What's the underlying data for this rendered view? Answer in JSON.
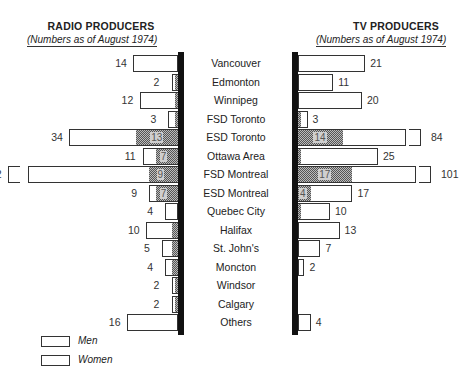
{
  "left_panel": {
    "title": "RADIO PRODUCERS",
    "subtitle": "(Numbers as of August 1974)"
  },
  "right_panel": {
    "title": "TV PRODUCERS",
    "subtitle": "(Numbers as of August 1974)"
  },
  "legend": {
    "men": "Men",
    "women": "Women"
  },
  "colors": {
    "men_fill": "#ffffff",
    "women_fill": "#999999",
    "axis": "#111111"
  },
  "chart_data": {
    "type": "bar",
    "orientation": "horizontal-back-to-back",
    "categories": [
      "Vancouver",
      "Edmonton",
      "Winnipeg",
      "FSD Toronto",
      "ESD Toronto",
      "Ottawa Area",
      "FSD Montreal",
      "ESD Montreal",
      "Quebec City",
      "Halifax",
      "St. John's",
      "Moncton",
      "Windsor",
      "Calgary",
      "Others"
    ],
    "panels": [
      {
        "name": "RADIO PRODUCERS",
        "direction": "left",
        "series": [
          {
            "name": "Men",
            "values": [
              14,
              2,
              12,
              3,
              34,
              11,
              52,
              9,
              4,
              10,
              5,
              4,
              2,
              2,
              16
            ]
          },
          {
            "name": "Women",
            "values": [
              0,
              1,
              1,
              1,
              13,
              7,
              9,
              7,
              0,
              2,
              2,
              2,
              1,
              1,
              0
            ]
          }
        ],
        "women_labels_shown": [
          null,
          null,
          null,
          null,
          13,
          7,
          9,
          7,
          null,
          null,
          null,
          null,
          null,
          null,
          null
        ],
        "broken_bars": [
          "FSD Montreal"
        ]
      },
      {
        "name": "TV PRODUCERS",
        "direction": "right",
        "series": [
          {
            "name": "Men",
            "values": [
              21,
              11,
              20,
              3,
              84,
              25,
              101,
              17,
              10,
              13,
              7,
              2,
              0,
              0,
              4
            ]
          },
          {
            "name": "Women",
            "values": [
              0,
              0,
              0,
              1,
              14,
              1,
              17,
              4,
              1,
              0,
              0,
              0,
              0,
              0,
              0
            ]
          }
        ],
        "women_labels_shown": [
          null,
          null,
          null,
          null,
          14,
          null,
          17,
          4,
          null,
          null,
          null,
          null,
          null,
          null,
          null
        ],
        "broken_bars": [
          "ESD Toronto",
          "FSD Montreal"
        ]
      }
    ],
    "legend": [
      "Men",
      "Women"
    ],
    "legend_position": "bottom-left",
    "grid": false
  }
}
